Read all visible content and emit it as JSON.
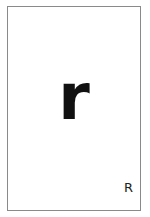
{
  "card": {
    "main_letter": "r",
    "corner_letter": "R",
    "border_color": "#8a8a8a",
    "text_color": "#111111"
  }
}
